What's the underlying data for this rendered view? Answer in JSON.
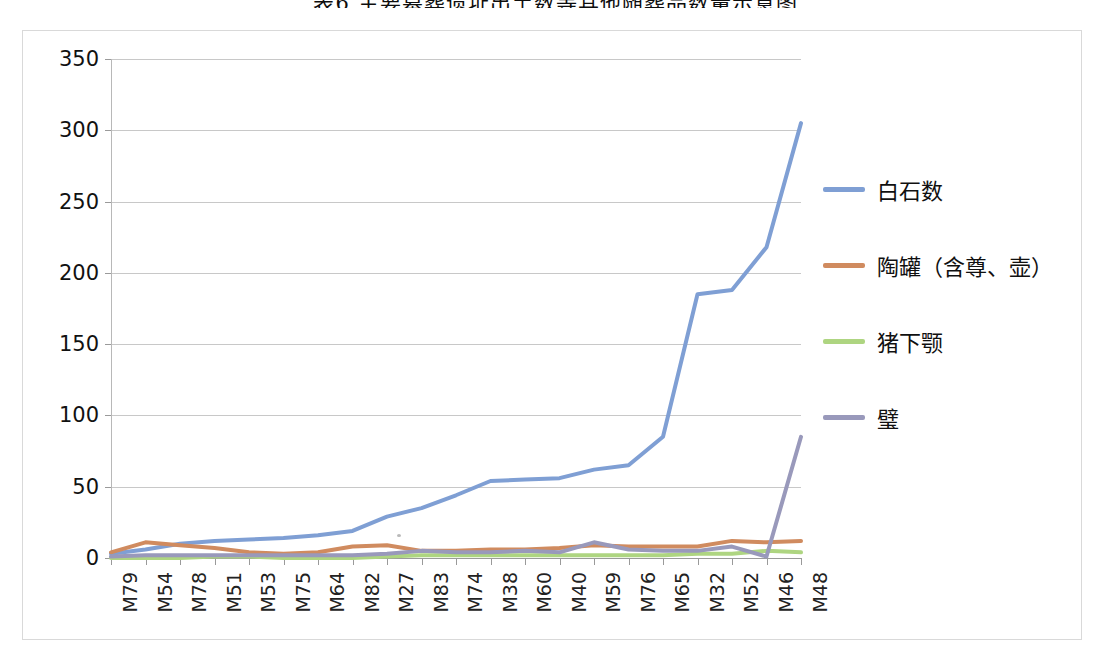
{
  "figure": {
    "title": "表6  主要墓葬遗址出土数等其他随葬品数量示意图"
  },
  "chart_data": {
    "type": "line",
    "title": "表6  主要墓葬遗址出土数等其他随葬品数量示意图",
    "xlabel": "",
    "ylabel": "",
    "ylim": [
      0,
      350
    ],
    "ytick_step": 50,
    "yticks": [
      "0",
      "50",
      "100",
      "150",
      "200",
      "250",
      "300",
      "350"
    ],
    "grid": true,
    "legend_position": "right",
    "categories": [
      "M79",
      "M54",
      "M78",
      "M51",
      "M53",
      "M75",
      "M64",
      "M82",
      "M27",
      "M83",
      "M74",
      "M38",
      "M60",
      "M40",
      "M59",
      "M76",
      "M65",
      "M32",
      "M52",
      "M46",
      "M48"
    ],
    "series": [
      {
        "name": "白石数",
        "color": "#7f9fd4",
        "values": [
          3,
          6,
          10,
          12,
          13,
          14,
          16,
          19,
          29,
          35,
          44,
          54,
          55,
          56,
          62,
          65,
          85,
          185,
          188,
          218,
          305
        ]
      },
      {
        "name": "陶罐（含尊、壶）",
        "color": "#d08b5f",
        "values": [
          4,
          11,
          9,
          7,
          4,
          3,
          4,
          8,
          9,
          5,
          5,
          6,
          6,
          7,
          9,
          8,
          8,
          8,
          12,
          11,
          12
        ]
      },
      {
        "name": "猪下颚",
        "color": "#aed581",
        "values": [
          0,
          0,
          0,
          1,
          1,
          0,
          0,
          0,
          1,
          2,
          2,
          2,
          2,
          2,
          2,
          2,
          2,
          3,
          3,
          5,
          4
        ]
      },
      {
        "name": "璧",
        "color": "#9999bb",
        "values": [
          1,
          2,
          2,
          2,
          2,
          2,
          2,
          2,
          3,
          5,
          4,
          4,
          5,
          4,
          11,
          6,
          5,
          5,
          8,
          1,
          85
        ]
      }
    ]
  },
  "legend": {
    "items": [
      {
        "label": "白石数",
        "color": "#7f9fd4"
      },
      {
        "label": "陶罐（含尊、壶）",
        "color": "#d08b5f"
      },
      {
        "label": "猪下颚",
        "color": "#aed581"
      },
      {
        "label": "璧",
        "color": "#9999bb"
      }
    ]
  }
}
